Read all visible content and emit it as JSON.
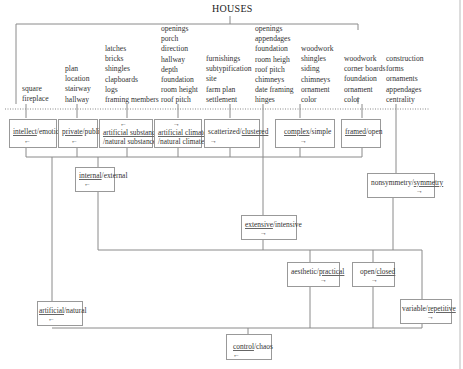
{
  "title": "HOUSES",
  "feature_columns": [
    {
      "items": [
        "square",
        "fireplace"
      ]
    },
    {
      "items": [
        "plan",
        "location",
        "stairway",
        "hallway"
      ]
    },
    {
      "items": [
        "latches",
        "bricks",
        "shingles",
        "clapboards",
        "logs",
        "framing members"
      ]
    },
    {
      "items": [
        "openings",
        "porch",
        "direction",
        "hallway",
        "depth",
        "foundation",
        "room height",
        "roof pitch"
      ]
    },
    {
      "items": [
        "furnishings",
        "subtypification",
        "site",
        "farm plan",
        "settlement"
      ]
    },
    {
      "items": [
        "openings",
        "appendages",
        "foundation",
        "room heigh",
        "roof pitch",
        "chimneys",
        "date framing",
        "hinges"
      ]
    },
    {
      "items": [
        "woodwork",
        "shingles",
        "siding",
        "chimneys",
        "ornament",
        "color"
      ]
    },
    {
      "items": [
        "woodwork",
        "corner boards",
        "foundation",
        "ornament",
        "color"
      ]
    },
    {
      "items": [
        "construction",
        "forms",
        "ornaments",
        "appendages",
        "centrality"
      ]
    }
  ],
  "oppositions": {
    "intellect_emotion": {
      "a": "intellect",
      "b": "emotion",
      "underlined": "intellect",
      "arrow": "←"
    },
    "private_public": {
      "a": "private",
      "b": "public",
      "underlined": "private",
      "arrow": "←"
    },
    "artificial_substance": {
      "a": "artificial substance",
      "b": "/natural substance",
      "underlined": "artificial substance",
      "arrow": "←"
    },
    "artificial_climate": {
      "a": "artificial climate",
      "b": "/natural climate",
      "underlined": "artificial climate",
      "arrow": "→"
    },
    "scatterized_clustered": {
      "a": "scatterized",
      "b": "clustered",
      "underlined": "clustered",
      "arrow": "→"
    },
    "complex_simple": {
      "a": "complex",
      "b": "simple",
      "underlined": "complex",
      "arrow": "→"
    },
    "framed_open": {
      "a": "framed",
      "b": "open",
      "underlined": "framed",
      "arrow": ""
    },
    "internal_external": {
      "a": "internal",
      "b": "external",
      "underlined": "internal",
      "arrow": "←"
    },
    "nonsymmetry_symmetry": {
      "a": "nonsymmetry",
      "b": "symmetry",
      "underlined": "symmetry",
      "arrow": "→"
    },
    "extensive_intensive": {
      "a": "extensive",
      "b": "intensive",
      "underlined": "extensive",
      "arrow": "→"
    },
    "aesthetic_practical": {
      "a": "aesthetic",
      "b": "practical",
      "underlined": "practical",
      "arrow": "→"
    },
    "open_closed": {
      "a": "open",
      "b": "closed",
      "underlined": "closed",
      "arrow": "→"
    },
    "artificial_natural": {
      "a": "artificial",
      "b": "natural",
      "underlined": "artificial",
      "arrow": "←"
    },
    "variable_repetitive": {
      "a": "variable",
      "b": "repetitive",
      "underlined": "repetitive",
      "arrow": "→"
    },
    "control_chaos": {
      "a": "control",
      "b": "chaos",
      "underlined": "control",
      "arrow": "←"
    }
  },
  "separator": "/",
  "colors": {
    "line": "#8a8a8a",
    "box_border": "#999999",
    "text": "#333333"
  }
}
